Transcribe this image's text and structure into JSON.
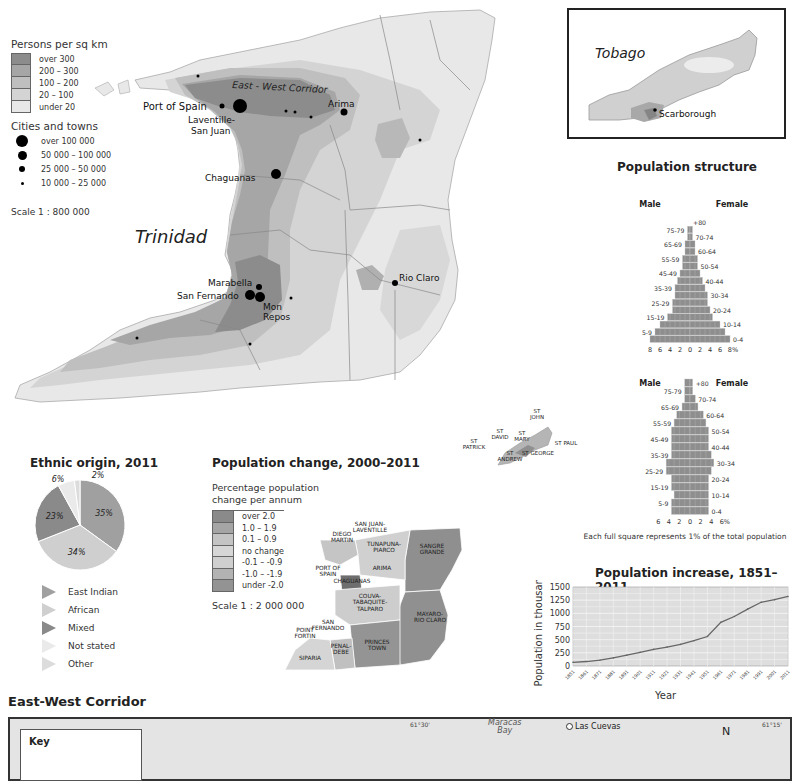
{
  "main_map": {
    "title": "Trinidad",
    "corridor_label": "East - West Corridor",
    "density_legend": {
      "title": "Persons per sq km",
      "items": [
        {
          "label": "over 300",
          "color": "#8c8c8c"
        },
        {
          "label": "200 – 300",
          "color": "#a6a6a6"
        },
        {
          "label": "100 – 200",
          "color": "#bfbfbf"
        },
        {
          "label": "20 – 100",
          "color": "#d4d4d4"
        },
        {
          "label": "under 20",
          "color": "#e8e8e8"
        }
      ]
    },
    "cities_legend": {
      "title": "Cities and towns",
      "items": [
        {
          "label": "over 100 000",
          "size": "xl"
        },
        {
          "label": "50 000 – 100 000",
          "size": "l"
        },
        {
          "label": "25 000 – 50 000",
          "size": "m"
        },
        {
          "label": "10 000 – 25 000",
          "size": "s"
        }
      ]
    },
    "scale": "Scale 1 : 800 000",
    "cities": [
      {
        "name": "Port of Spain"
      },
      {
        "name": "Laventille-\nSan Juan"
      },
      {
        "name": "Arima"
      },
      {
        "name": "Chaguanas"
      },
      {
        "name": "Marabella"
      },
      {
        "name": "San Fernando"
      },
      {
        "name": "Mon\nRepos"
      },
      {
        "name": "Rio Claro"
      }
    ]
  },
  "tobago_inset": {
    "title": "Tobago",
    "city": "Scarborough"
  },
  "population_structure": {
    "title": "Population structure",
    "male_label": "Male",
    "female_label": "Female",
    "note": "Each full square represents 1% of the total population"
  },
  "chart_data": [
    {
      "type": "bar",
      "title": "Population structure 1955",
      "subtitle": "1955",
      "orientation": "horizontal-pyramid",
      "categories": [
        "0-4",
        "5-9",
        "10-14",
        "15-19",
        "20-24",
        "25-29",
        "30-34",
        "35-39",
        "40-44",
        "45-49",
        "50-54",
        "55-59",
        "60-64",
        "65-69",
        "70-74",
        "75-79",
        "+80"
      ],
      "series": [
        {
          "name": "Male",
          "values": [
            8.0,
            7.0,
            6.0,
            4.5,
            3.5,
            3.5,
            3.0,
            3.0,
            2.5,
            2.0,
            1.5,
            1.5,
            1.0,
            1.0,
            0.5,
            0.5,
            0.0
          ]
        },
        {
          "name": "Female",
          "values": [
            8.0,
            7.0,
            6.0,
            4.5,
            4.0,
            3.5,
            3.5,
            3.0,
            2.5,
            2.0,
            1.5,
            1.5,
            1.0,
            1.0,
            0.5,
            0.5,
            0.0
          ]
        }
      ],
      "xticks": [
        "8",
        "6",
        "4",
        "2",
        "0",
        "2",
        "4",
        "6",
        "8%"
      ],
      "xlim": [
        -8,
        8
      ]
    },
    {
      "type": "bar",
      "title": "Population structure 2015",
      "subtitle": "2015",
      "orientation": "horizontal-pyramid",
      "categories": [
        "0-4",
        "5-9",
        "10-14",
        "15-19",
        "20-24",
        "25-29",
        "30-34",
        "35-39",
        "40-44",
        "45-49",
        "50-54",
        "55-59",
        "60-64",
        "65-69",
        "70-74",
        "75-79",
        "+80"
      ],
      "series": [
        {
          "name": "Male",
          "values": [
            3.5,
            3.5,
            3.0,
            3.5,
            3.5,
            4.5,
            4.5,
            3.5,
            3.5,
            3.5,
            3.5,
            3.0,
            2.5,
            1.5,
            1.0,
            1.0,
            1.0
          ]
        },
        {
          "name": "Female",
          "values": [
            3.5,
            3.5,
            3.5,
            3.5,
            3.5,
            4.0,
            4.5,
            4.0,
            3.5,
            3.5,
            3.5,
            3.0,
            2.5,
            1.5,
            1.0,
            0.5,
            0.5
          ]
        }
      ],
      "xticks": [
        "6",
        "4",
        "2",
        "0",
        "2",
        "4",
        "6%"
      ],
      "xlim": [
        -6,
        6
      ]
    },
    {
      "type": "line",
      "title": "Population increase, 1851–2011",
      "xlabel": "Year",
      "ylabel": "Population in thousands",
      "x": [
        1851,
        1861,
        1871,
        1881,
        1891,
        1901,
        1911,
        1921,
        1931,
        1941,
        1951,
        1961,
        1971,
        1981,
        1991,
        2001,
        2011
      ],
      "series": [
        {
          "name": "Population",
          "values": [
            70,
            85,
            110,
            155,
            205,
            260,
            315,
            360,
            410,
            480,
            560,
            830,
            940,
            1080,
            1210,
            1260,
            1320
          ]
        }
      ],
      "yticks": [
        0,
        250,
        500,
        750,
        1000,
        1250,
        1500
      ],
      "ylim": [
        0,
        1500
      ],
      "grid": true
    },
    {
      "type": "pie",
      "title": "Ethnic origin, 2011",
      "labels": [
        "East Indian",
        "African",
        "Mixed",
        "Not stated",
        "Other"
      ],
      "values": [
        35,
        34,
        23,
        6,
        2
      ],
      "value_labels": [
        "35%",
        "34%",
        "23%",
        "6%",
        "2%"
      ],
      "colors": [
        "#a0a0a0",
        "#cfcfcf",
        "#8a8a8a",
        "#eaeaea",
        "#dcdcdc"
      ],
      "legend": "bottom"
    }
  ],
  "population_change": {
    "title": "Population change, 2000–2011",
    "legend_title": "Percentage population\nchange per annum",
    "legend": [
      {
        "label": "over 2.0",
        "color": "#8a8a8a"
      },
      {
        "label": "1.0 – 1.9",
        "color": "#a5a5a5"
      },
      {
        "label": "0.1 – 0.9",
        "color": "#c4c4c4"
      },
      {
        "label": "no change",
        "color": "#d6d6d6"
      },
      {
        "label": "-0.1 – -0.9",
        "color": "#cfcfcf"
      },
      {
        "label": "-1.0 – -1.9",
        "color": "#b3b3b3"
      },
      {
        "label": "under -2.0",
        "color": "#939393"
      }
    ],
    "scale": "Scale 1 : 2 000 000",
    "regions": [
      "SAN JUAN-\nLAVENTILLE",
      "DIEGO\nMARTIN",
      "TUNAPUNA-\nPIARCO",
      "PORT OF\nSPAIN",
      "ARIMA",
      "SANGRE\nGRANDE",
      "CHAGUANAS",
      "COUVA-\nTABAQUITE-\nTALPARO",
      "MAYARO-\nRIO CLARO",
      "SAN\nFERNANDO",
      "POINT\nFORTIN",
      "PRINCES\nTOWN",
      "PENAL-\nDEBE",
      "SIPARIA"
    ],
    "tobago_parishes": [
      "ST\nJOHN",
      "ST\nDAVID",
      "ST\nMARY",
      "ST PAUL",
      "ST\nPATRICK",
      "ST GEORGE",
      "ST\nANDREW"
    ]
  },
  "corridor_section": {
    "title": "East-West Corridor",
    "key_label": "Key",
    "labels": [
      "Maracas\nBay",
      "Las Cuevas",
      "N"
    ],
    "coords": [
      "61°30'",
      "61°15'"
    ]
  }
}
